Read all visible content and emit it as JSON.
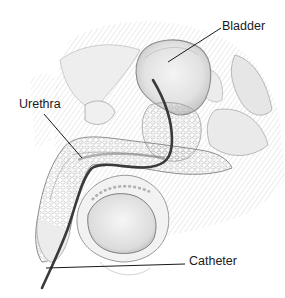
{
  "figure": {
    "type": "anatomical-illustration",
    "labels": [
      {
        "id": "bladder",
        "text": "Bladder"
      },
      {
        "id": "urethra",
        "text": "Urethra"
      },
      {
        "id": "catheter",
        "text": "Catheter"
      }
    ],
    "colors": {
      "background": "#ffffff",
      "tissue_line": "#9a9a9a",
      "tissue_shade": "#d8d8d8",
      "catheter": "#3a3a3a",
      "label_text": "#1a1a1a",
      "leader_line": "#1a1a1a"
    }
  }
}
